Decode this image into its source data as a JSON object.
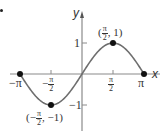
{
  "chart_data": {
    "type": "line",
    "title": "",
    "function": "y = sin(x)",
    "xlabel": "x",
    "ylabel": "y",
    "xlim": [
      -3.1416,
      3.1416
    ],
    "ylim": [
      -1,
      1
    ],
    "grid": false,
    "legend": null,
    "x_ticks": [
      {
        "value": -3.1416,
        "label": "−π"
      },
      {
        "value": -1.5708,
        "label": "−π/2"
      },
      {
        "value": 1.5708,
        "label": "π/2"
      },
      {
        "value": 3.1416,
        "label": "π"
      }
    ],
    "y_ticks": [
      {
        "value": 1,
        "label": "1"
      },
      {
        "value": -1,
        "label": "−1"
      }
    ],
    "series": [
      {
        "name": "sin x",
        "color": "#6e6e6e",
        "x": [
          -3.1416,
          -2.3562,
          -1.5708,
          -0.7854,
          0,
          0.7854,
          1.5708,
          2.3562,
          3.1416
        ],
        "y": [
          0,
          -0.7071,
          -1,
          -0.7071,
          0,
          0.7071,
          1,
          0.7071,
          0
        ]
      }
    ],
    "points": [
      {
        "x": -3.1416,
        "y": 0,
        "label": ""
      },
      {
        "x": -1.5708,
        "y": -1,
        "label": "(−π/2, −1)"
      },
      {
        "x": 1.5708,
        "y": 1,
        "label": "(π/2, 1)"
      },
      {
        "x": 3.1416,
        "y": 0,
        "label": ""
      }
    ],
    "annotations": [
      "(π/2, 1)",
      "(−π/2, −1)"
    ]
  },
  "labels": {
    "x_axis": "x",
    "y_axis": "y",
    "neg_pi": "−π",
    "pi": "π",
    "neg": "−",
    "pi_sym": "π",
    "two": "2",
    "one": "1",
    "neg_one": "−1",
    "max_point_open": "(",
    "max_point_close": ", 1)",
    "min_point_open": "(−",
    "min_point_close": ", −1)"
  },
  "colors": {
    "curve": "#6e6e6e",
    "axis": "#8a8a8a",
    "point": "#111111",
    "text": "#333333"
  }
}
